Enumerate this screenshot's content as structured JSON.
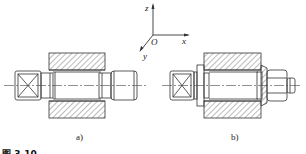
{
  "axes": {
    "x_label": "x",
    "y_label": "y",
    "z_label": "z",
    "origin_label": "O"
  },
  "subfigures": [
    {
      "label": "a)",
      "description": "shaft with square head passing through hatched bore, threaded end"
    },
    {
      "label": "b)",
      "description": "shaft with square head, flange washer, tapered nut fastened through hatched bore"
    }
  ],
  "caption": {
    "text": "图 3-10"
  },
  "colors": {
    "line": "#333333",
    "hatch": "#555555",
    "centerline": "#444444"
  }
}
